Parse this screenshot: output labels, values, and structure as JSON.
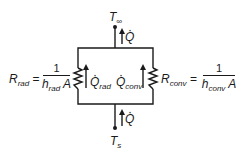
{
  "diagram": {
    "nodes": {
      "top": {
        "symbol": "T",
        "subscript": "∞"
      },
      "bottom": {
        "symbol": "T",
        "subscript": "s"
      }
    },
    "heat_flows": {
      "total_top": {
        "symbol": "Q"
      },
      "total_bottom": {
        "symbol": "Q"
      },
      "radiation": {
        "symbol": "Q",
        "subscript": "rad"
      },
      "convection": {
        "symbol": "Q",
        "subscript": "conv"
      }
    },
    "resistances": {
      "radiation": {
        "symbol": "R",
        "subscript": "rad",
        "equals": "=",
        "numerator": "1",
        "den_symbol": "h",
        "den_subscript": "rad",
        "den_area": "A"
      },
      "convection": {
        "symbol": "R",
        "subscript": "conv",
        "equals": "=",
        "numerator": "1",
        "den_symbol": "h",
        "den_subscript": "conv",
        "den_area": "A"
      }
    },
    "colors": {
      "line": "#1a1a1a",
      "background": "#ffffff"
    }
  }
}
